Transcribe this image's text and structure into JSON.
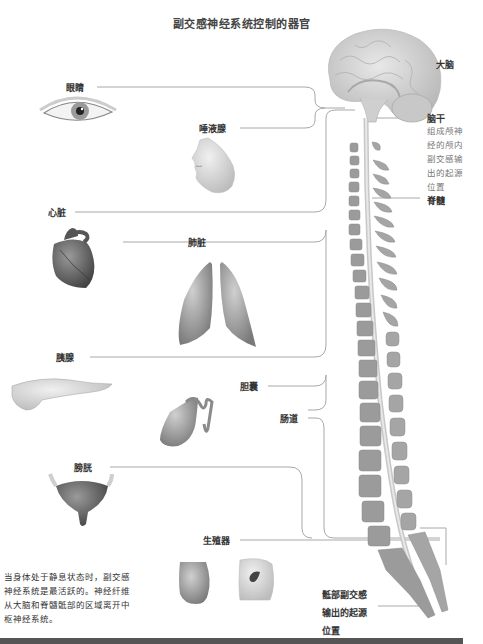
{
  "title": "副交感神经系统控制的器官",
  "organs": {
    "eye": "眼睛",
    "salivary": "唾液腺",
    "heart": "心脏",
    "lungs": "肺脏",
    "pancreas": "胰腺",
    "gallbladder": "胆囊",
    "intestine": "肠道",
    "bladder": "膀胱",
    "genitals": "生殖器"
  },
  "cns": {
    "brain": "大脑",
    "brainstem": "脑干",
    "brainstem_note": [
      "组成颅神",
      "经的颅内",
      "副交感输",
      "出的起源",
      "位置"
    ],
    "spinal_cord": "脊髓",
    "sacral": [
      "骶部副交感",
      "输出的起源",
      "位置"
    ]
  },
  "caption": [
    "当身体处于静息状态时，副交感",
    "神经系统是最活跃的。神经纤维",
    "从大脑和脊髓骶部的区域离开中",
    "枢神经系统。"
  ],
  "colors": {
    "line": "#9a9a9a",
    "organ_gray": "#8a8a8a",
    "bone": "#9b9b9b",
    "brain": "#d4d4d4",
    "bar": "#555555"
  }
}
